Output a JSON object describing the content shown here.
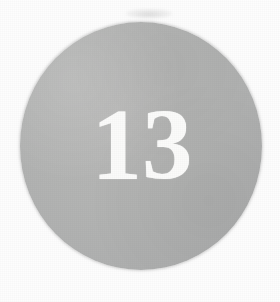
{
  "page": {
    "kind": "numbered-circle-badge",
    "background_color": "#fdfdfd",
    "width_px": 280,
    "height_px": 302
  },
  "badge": {
    "number": "13",
    "number_color": "#fbfbfa",
    "fill_color": "#b3b4b3",
    "shape": "circle",
    "diameter_px": 245
  },
  "artifacts": {
    "grain_label": "scan-grain",
    "smudge_label": "scan-smudge"
  }
}
